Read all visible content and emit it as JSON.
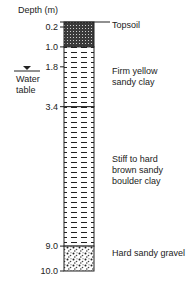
{
  "axis_title": "Depth (m)",
  "depth_ticks": [
    "0.2",
    "1.0",
    "1.8",
    "3.4",
    "9.0",
    "10.0"
  ],
  "depth_values": [
    0.2,
    1.0,
    1.8,
    3.4,
    9.0,
    10.0
  ],
  "layers": [
    {
      "from": 0.0,
      "to": 1.0,
      "pattern": "dotted-dark",
      "label_lines": [
        "Topsoil"
      ]
    },
    {
      "from": 1.0,
      "to": 3.4,
      "pattern": "dashes",
      "label_lines": [
        "Firm yellow",
        "sandy clay"
      ]
    },
    {
      "from": 3.4,
      "to": 9.0,
      "pattern": "dashes",
      "label_lines": [
        "Stiff to hard",
        "brown sandy",
        "boulder clay"
      ]
    },
    {
      "from": 9.0,
      "to": 10.0,
      "pattern": "gravel",
      "label_lines": [
        "Hard sandy gravel"
      ]
    }
  ],
  "water_table": {
    "depth": 1.8,
    "label_lines": [
      "Water",
      "table"
    ]
  },
  "colors": {
    "ink": "#222222",
    "topsoil": "#3a3a3a",
    "background": "#ffffff"
  }
}
